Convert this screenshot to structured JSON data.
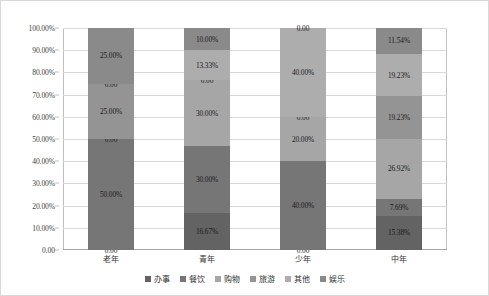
{
  "chart_data": {
    "type": "bar",
    "subtype": "stacked-100-percent",
    "title": "",
    "xlabel": "",
    "ylabel": "",
    "ylim": [
      0,
      100
    ],
    "grid": true,
    "legend_position": "bottom",
    "categories": [
      "老年",
      "青年",
      "少年",
      "中年"
    ],
    "y_ticks": [
      "0.00",
      "10.00%",
      "20.00%",
      "30.00%",
      "40.00%",
      "50.00%",
      "60.00%",
      "70.00%",
      "80.00%",
      "90.00%",
      "100.00%"
    ],
    "y_tick_values": [
      0,
      10,
      20,
      30,
      40,
      50,
      60,
      70,
      80,
      90,
      100
    ],
    "series": [
      {
        "name": "办事",
        "color": "#636363",
        "values": [
          0,
          16.67,
          0,
          15.38
        ],
        "labels": [
          "0.00",
          "16.67%",
          "0.00",
          "15.38%"
        ]
      },
      {
        "name": "餐饮",
        "color": "#767676",
        "values": [
          50.0,
          30.0,
          40.0,
          7.69
        ],
        "labels": [
          "50.00%",
          "30.00%",
          "40.00%",
          "7.69%"
        ]
      },
      {
        "name": "购物",
        "color": "#a6a6a6",
        "values": [
          0,
          30.0,
          20.0,
          26.92
        ],
        "labels": [
          "0.00",
          "30.00%",
          "20.00%",
          "26.92%"
        ]
      },
      {
        "name": "旅游",
        "color": "#949494",
        "values": [
          25.0,
          0,
          0,
          19.23
        ],
        "labels": [
          "25.00%",
          "0.00",
          "0.00",
          "19.23%"
        ]
      },
      {
        "name": "其他",
        "color": "#adadad",
        "values": [
          0,
          13.33,
          40.0,
          19.23
        ],
        "labels": [
          "0.00",
          "13.33%",
          "40.00%",
          "19.23%"
        ]
      },
      {
        "name": "娱乐",
        "color": "#8a8a8a",
        "values": [
          25.0,
          10.0,
          0,
          11.54
        ],
        "labels": [
          "25.00%",
          "10.00%",
          "0.00",
          "11.54%"
        ]
      }
    ]
  }
}
